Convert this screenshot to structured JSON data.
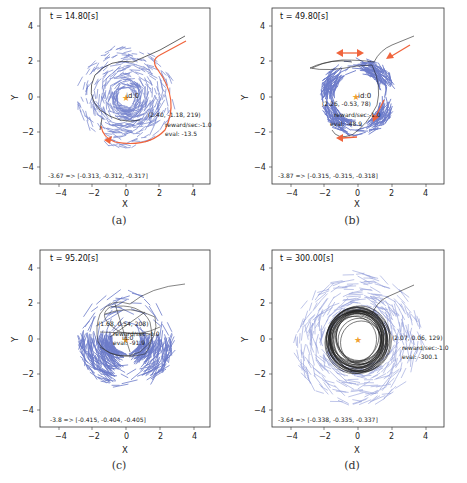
{
  "figure": {
    "caption_partial": "",
    "panels": [
      {
        "id": "a",
        "sublabel": "(a)",
        "time_label": "t = 14.80[s]",
        "agent_label": "id:0",
        "state": "(2.40, -1.18, 219)",
        "reward": "reward/sec:-1.0",
        "eval": "eval: -13.5",
        "value_line": "-3.67 => [-0.313, -0.312, -0.317]"
      },
      {
        "id": "b",
        "sublabel": "(b)",
        "time_label": "t = 49.80[s]",
        "agent_label": "id:0",
        "state": "(2.26, -0.53, 78)",
        "reward": "reward/sec:-1.0",
        "eval": "eval: -48.9",
        "value_line": "-3.87 => [-0.315, -0.315, -0.318]"
      },
      {
        "id": "c",
        "sublabel": "(c)",
        "time_label": "t = 95.20[s]",
        "agent_label": "id:0",
        "state": "(1.68, 0.54, 208)",
        "reward": "reward/sec:-1.0",
        "eval": "eval: -91.9",
        "value_line": "-3.8 => [-0.415, -0.404, -0.405]"
      },
      {
        "id": "d",
        "sublabel": "(d)",
        "time_label": "t = 300.00[s]",
        "agent_label": "id:0",
        "state": "(2.07, 0.06, 129)",
        "reward": "reward/sec:-1.0",
        "eval": "eval: -300.1",
        "value_line": "-3.64 => [-0.338, -0.335, -0.337]"
      }
    ],
    "axis": {
      "xlabel": "X",
      "ylabel": "Y",
      "xticks": [
        "−4",
        "−2",
        "0",
        "2",
        "4"
      ],
      "yticks": [
        "4",
        "2",
        "0",
        "−2",
        "−4"
      ]
    },
    "colors": {
      "particles": "#3b4fb8",
      "trajectory": "#222222",
      "highlight": "#f0643c",
      "goal": "#f0a030"
    }
  },
  "chart_data": [
    {
      "type": "scatter",
      "title": "t = 14.80[s]",
      "xlabel": "X",
      "ylabel": "Y",
      "xlim": [
        -5,
        5
      ],
      "ylim": [
        -5,
        5
      ],
      "xticks": [
        -4,
        -2,
        0,
        2,
        4
      ],
      "yticks": [
        -4,
        -2,
        0,
        2,
        4
      ],
      "annotations": [
        "id:0",
        "(2.40, -1.18, 219)",
        "reward/sec:-1.0",
        "eval: -13.5",
        "-3.67 => [-0.313, -0.312, -0.317]"
      ],
      "series": [
        {
          "name": "particles",
          "description": "blue short line segments forming a swirl of radius ~2 around origin, dense at lower right (~(1,-1.5))"
        },
        {
          "name": "trajectory",
          "description": "black path from (3.5,3.5) into (0.5,2) then circling"
        },
        {
          "name": "highlight",
          "description": "orange arrow curve from (3.6,3.2) around right side down to (-1,-2.4)"
        }
      ]
    },
    {
      "type": "scatter",
      "title": "t = 49.80[s]",
      "xlabel": "X",
      "ylabel": "Y",
      "xlim": [
        -5,
        5
      ],
      "ylim": [
        -5,
        5
      ],
      "xticks": [
        -4,
        -2,
        0,
        2,
        4
      ],
      "yticks": [
        -4,
        -2,
        0,
        2,
        4
      ],
      "annotations": [
        "id:0",
        "(2.26, -0.53, 78)",
        "reward/sec:-1.0",
        "eval: -48.9",
        "-3.87 => [-0.315, -0.315, -0.318]"
      ],
      "series": [
        {
          "name": "particles",
          "description": "blue segments concentrated in a ring of radius ~1.8"
        },
        {
          "name": "trajectory",
          "description": "black loops around ring"
        },
        {
          "name": "highlight",
          "description": "orange arrows: double-headed at top (~y=2.6), incoming from upper right, on right side, and at bottom-left pointing left"
        }
      ]
    },
    {
      "type": "scatter",
      "title": "t = 95.20[s]",
      "xlabel": "X",
      "ylabel": "Y",
      "xlim": [
        -5,
        5
      ],
      "ylim": [
        -5,
        5
      ],
      "xticks": [
        -4,
        -2,
        0,
        2,
        4
      ],
      "yticks": [
        -4,
        -2,
        0,
        2,
        4
      ],
      "annotations": [
        "id:0",
        "(1.68, 0.54, 208)",
        "reward/sec:-1.0",
        "eval: -91.9",
        "-3.8 => [-0.415, -0.404, -0.405]"
      ],
      "series": [
        {
          "name": "particles",
          "description": "blue segments clustered left (~(-1.7,-1.3)) and right (~(1.6,-0.5))"
        },
        {
          "name": "trajectory",
          "description": "black tangled loops within radius ~2"
        }
      ]
    },
    {
      "type": "scatter",
      "title": "t = 300.00[s]",
      "xlabel": "X",
      "ylabel": "Y",
      "xlim": [
        -5,
        5
      ],
      "ylim": [
        -5,
        5
      ],
      "xticks": [
        -4,
        -2,
        0,
        2,
        4
      ],
      "yticks": [
        -4,
        -2,
        0,
        2,
        4
      ],
      "annotations": [
        "id:0",
        "(2.07, 0.06, 129)",
        "reward/sec:-1.0",
        "eval: -300.1",
        "-3.64 => [-0.338, -0.335, -0.337]"
      ],
      "series": [
        {
          "name": "particles",
          "description": "blue segments in wide ring radius ~1.8-3.5 around origin"
        },
        {
          "name": "trajectory",
          "description": "dense black circular loops radius ~1.7 around origin"
        }
      ]
    }
  ]
}
